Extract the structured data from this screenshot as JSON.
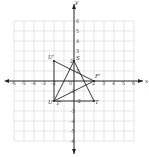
{
  "diagram": {
    "type": "coordinate-plane",
    "axes": {
      "x_label": "x",
      "y_label": "y",
      "range": [
        -6,
        6
      ]
    },
    "x_ticks": [
      "-6",
      "-5",
      "-4",
      "-3",
      "-2",
      "0",
      "2",
      "3",
      "4",
      "5",
      "6"
    ],
    "y_ticks": [
      "6",
      "5",
      "4",
      "3",
      "2",
      "1",
      "-1",
      "-2",
      "-3",
      "-4",
      "-5",
      "-6"
    ],
    "triangles": [
      {
        "name": "STU",
        "vertices": [
          {
            "label": "S",
            "x": 0,
            "y": 2
          },
          {
            "label": "T",
            "x": 2,
            "y": -2
          },
          {
            "label": "U",
            "x": -2,
            "y": -2
          }
        ]
      },
      {
        "name": "U'F'T'",
        "vertices": [
          {
            "label": "U'",
            "x": -2,
            "y": 2
          },
          {
            "label": "F'",
            "x": 2,
            "y": 0
          },
          {
            "label": "T'",
            "x": -2,
            "y": -2
          }
        ]
      }
    ],
    "labels": {
      "S": "S",
      "T": "T",
      "U": "U",
      "U_prime": "U'",
      "F_prime": "F'",
      "T_prime": "T'",
      "x": "x",
      "y": "y"
    }
  }
}
